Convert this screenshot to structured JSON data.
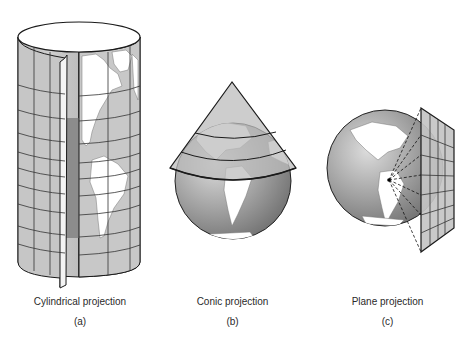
{
  "figure": {
    "panels": [
      {
        "id": "a",
        "title": "Cylindrical projection",
        "letter": "(a)",
        "surface": "cylinder"
      },
      {
        "id": "b",
        "title": "Conic projection",
        "letter": "(b)",
        "surface": "cone"
      },
      {
        "id": "c",
        "title": "Plane projection",
        "letter": "(c)",
        "surface": "plane"
      }
    ],
    "colors": {
      "background": "#ffffff",
      "ocean": "#a9a9a9",
      "land": "#ffffff",
      "surface": "#c8c8c8",
      "line": "#1a1a1a"
    }
  }
}
